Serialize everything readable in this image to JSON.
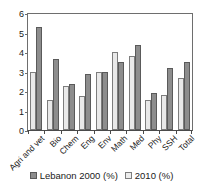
{
  "chart_data": {
    "type": "bar",
    "title": "",
    "xlabel": "",
    "ylabel": "",
    "ylim": [
      0,
      6
    ],
    "yticks": [
      0,
      1,
      2,
      3,
      4,
      5,
      6
    ],
    "grid": false,
    "legend_position": "bottom",
    "categories": [
      "Agri and vet",
      "Bio",
      "Chem",
      "Eng",
      "Env",
      "Math",
      "Med",
      "Phy",
      "SSH",
      "Total"
    ],
    "series": [
      {
        "name": "Lebanon 2000 (%)",
        "color": "#8d8d8d",
        "values": [
          5.3,
          3.65,
          2.35,
          2.85,
          2.95,
          3.5,
          4.38,
          1.88,
          3.2,
          3.5
        ]
      },
      {
        "name": "2010 (%)",
        "color": "#ededed",
        "values": [
          3.0,
          1.52,
          2.28,
          1.72,
          2.97,
          4.02,
          3.82,
          1.55,
          1.82,
          2.65
        ]
      }
    ]
  },
  "legend": {
    "items": [
      {
        "label": "Lebanon 2000 (%)"
      },
      {
        "label": "2010 (%)"
      }
    ]
  }
}
